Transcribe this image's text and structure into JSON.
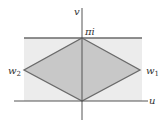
{
  "diagram": {
    "axes": {
      "horizontal_label": "u",
      "vertical_label": "v"
    },
    "labels": {
      "top_vertex": "πi",
      "left_vertex": "w",
      "left_vertex_sub": "2",
      "right_vertex": "w",
      "right_vertex_sub": "1"
    },
    "colors": {
      "band_fill": "#ececec",
      "rhombus_fill": "#c8c8c8",
      "line": "#6a6a6a",
      "axis": "#555555"
    }
  }
}
